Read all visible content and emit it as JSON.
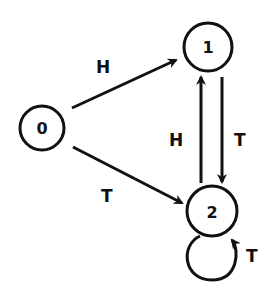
{
  "diagram": {
    "type": "state-transition",
    "nodes": [
      {
        "id": "0",
        "label": "0"
      },
      {
        "id": "1",
        "label": "1"
      },
      {
        "id": "2",
        "label": "2"
      }
    ],
    "edges": [
      {
        "from": "0",
        "to": "1",
        "label": "H"
      },
      {
        "from": "0",
        "to": "2",
        "label": "T"
      },
      {
        "from": "2",
        "to": "1",
        "label": "H"
      },
      {
        "from": "1",
        "to": "2",
        "label": "T"
      },
      {
        "from": "2",
        "to": "2",
        "label": "T"
      }
    ]
  }
}
